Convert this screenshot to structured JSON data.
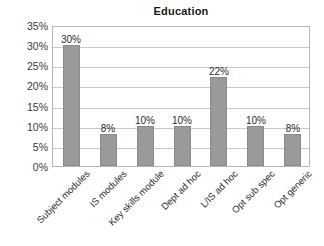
{
  "chart_data": {
    "type": "bar",
    "title": "Education",
    "xlabel": "",
    "ylabel": "",
    "categories": [
      "Subject modules",
      "IS modules",
      "Key skills module",
      "Dept ad hoc",
      "L/IS ad hoc",
      "Opt sub spec",
      "Opt generic"
    ],
    "values": [
      30,
      8,
      10,
      10,
      22,
      10,
      8
    ],
    "value_labels": [
      "30%",
      "8%",
      "10%",
      "10%",
      "22%",
      "10%",
      "8%"
    ],
    "ylim": [
      0,
      35
    ],
    "ytick_values": [
      0,
      5,
      10,
      15,
      20,
      25,
      30,
      35
    ],
    "ytick_labels": [
      "0%",
      "5%",
      "10%",
      "15%",
      "20%",
      "25%",
      "30%",
      "35%"
    ],
    "grid": true,
    "legend": false,
    "legend_position": "none",
    "bar_color": "#9a9a9a",
    "bar_border_color": "#8a8a8a",
    "gridline_color": "#c9c9c9",
    "plot_border_color": "#b6b6b6",
    "background_color": "#ffffff",
    "text_color": "#1a1a1a",
    "xtick_label_rotation": -45
  }
}
